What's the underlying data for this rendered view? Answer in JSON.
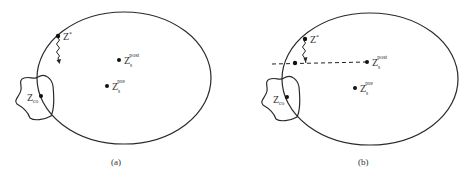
{
  "figure": {
    "panels": [
      {
        "id": "a",
        "caption": "(a)",
        "ellipse": {
          "cx": 124,
          "cy": 78,
          "rx": 87,
          "ry": 66
        },
        "labels": {
          "z_star": {
            "main": "Z",
            "sup": "*"
          },
          "z_post": {
            "main": "Z",
            "sub": "s",
            "sup": "post"
          },
          "z_pre": {
            "main": "Z",
            "sub": "s",
            "sup": "pre"
          },
          "z_co": {
            "main": "Z",
            "sub": "co"
          }
        }
      },
      {
        "id": "b",
        "caption": "(b)",
        "ellipse": {
          "cx": 370,
          "cy": 79,
          "rx": 88,
          "ry": 66
        },
        "labels": {
          "z_star": {
            "main": "Z",
            "sup": "*"
          },
          "z_post": {
            "main": "Z",
            "sub": "s",
            "sup": "post"
          },
          "z_pre": {
            "main": "Z",
            "sub": "s",
            "sup": "pre"
          },
          "z_co": {
            "main": "Z",
            "sub": "co"
          }
        }
      }
    ],
    "colors": {
      "stroke": "#2a2a2a",
      "text": "#333333",
      "background": "#ffffff"
    }
  }
}
